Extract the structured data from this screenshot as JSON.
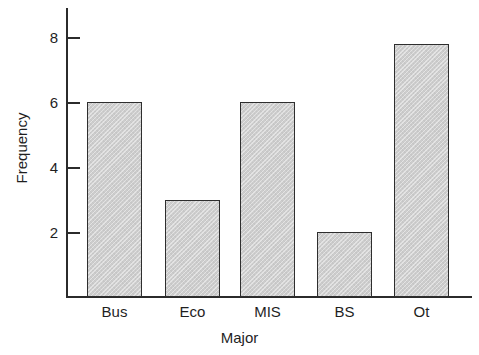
{
  "chart_data": {
    "type": "bar",
    "title": "",
    "subtitle": "",
    "xlabel": "Major",
    "ylabel": "Frequency",
    "categories": [
      "Bus",
      "Eco",
      "MIS",
      "BS",
      "Ot"
    ],
    "values": [
      6,
      3,
      6,
      2,
      7.8
    ],
    "ylim": [
      0,
      9
    ],
    "xlim_note": "categorical",
    "y_ticks": [
      2,
      4,
      6,
      8
    ],
    "y_tick_labels": [
      "2",
      "4",
      "6",
      "8"
    ],
    "grid": false,
    "legend": false,
    "legend_position": "none",
    "bars": [
      {
        "category": "Bus",
        "value": 6,
        "label": "Bus"
      },
      {
        "category": "Eco",
        "value": 3,
        "label": "Eco"
      },
      {
        "category": "MIS",
        "value": 6,
        "label": "MIS"
      },
      {
        "category": "BS",
        "value": 2,
        "label": "BS"
      },
      {
        "category": "Ot",
        "value": 7.8,
        "label": "Ot"
      }
    ],
    "colors": {
      "bar_fill": "#cdcdcd",
      "bar_stroke": "#2e2e2e",
      "axis": "#2b2b2b",
      "text": "#1f1f1f",
      "background": "#ffffff"
    }
  }
}
